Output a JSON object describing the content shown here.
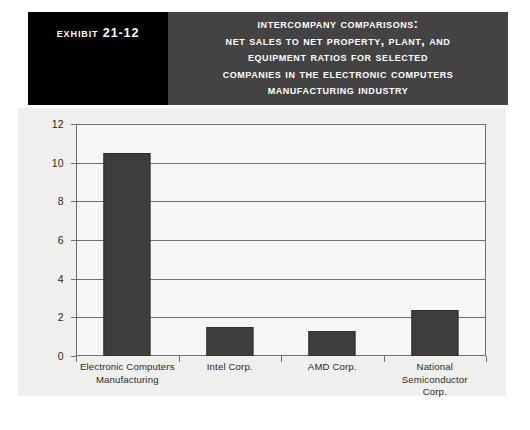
{
  "header": {
    "exhibit_label": "Exhibit 21-12",
    "title_lines": [
      "Intercompany Comparisons:",
      "Net Sales to Net Property, Plant, and",
      "Equipment Ratios for Selected",
      "Companies in the Electronic Computers",
      "Manufacturing Industry"
    ],
    "exhibit_block_color": "#000000",
    "title_block_color": "#434343",
    "title_text_color": "#ffffff"
  },
  "chart_data": {
    "type": "bar",
    "title": "Intercompany Comparisons: Net Sales to Net Property, Plant, and Equipment Ratios for Selected Companies in the Electronic Computers Manufacturing Industry",
    "xlabel": "",
    "ylabel": "",
    "categories": [
      "Electronic Computers Manufacturing",
      "Intel Corp.",
      "AMD Corp.",
      "National Semiconductor Corp."
    ],
    "category_lines": [
      [
        "Electronic Computers",
        "Manufacturing"
      ],
      [
        "Intel Corp."
      ],
      [
        "AMD Corp."
      ],
      [
        "National Semiconductor",
        "Corp."
      ]
    ],
    "values": [
      10.5,
      1.5,
      1.3,
      2.4
    ],
    "ylim": [
      0,
      12
    ],
    "yticks": [
      0,
      2,
      4,
      6,
      8,
      10,
      12
    ],
    "ytick_labels": [
      "0",
      "2",
      "4",
      "6",
      "8",
      "10",
      "12"
    ],
    "grid": true,
    "legend": false,
    "bar_color": "#3d3d3d",
    "plot_background": "#f6f6f4",
    "panel_background": "#efefed",
    "axis_color": "#6e6e6e"
  }
}
